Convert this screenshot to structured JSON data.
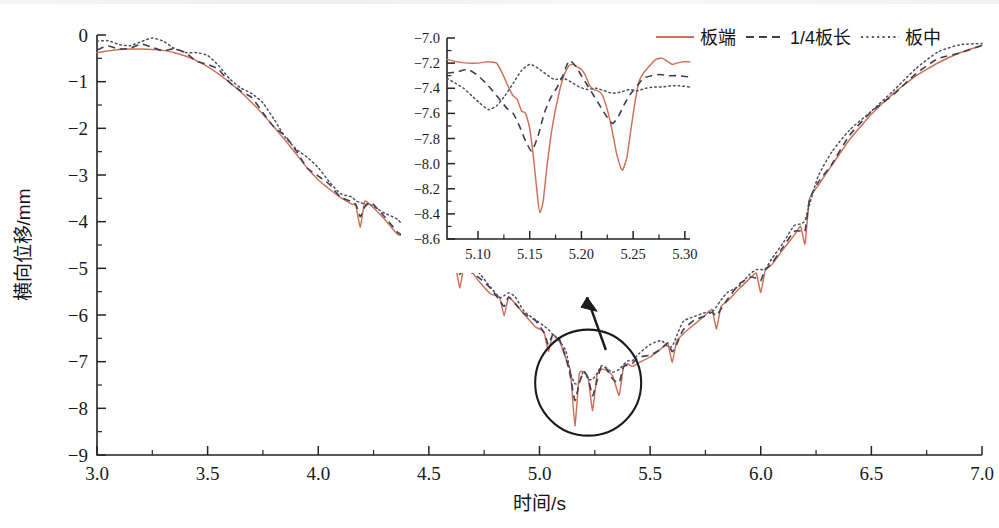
{
  "figure": {
    "background": "#ffffff",
    "colors": {
      "series_plate_end": "#cf6f57",
      "series_quarter": "#3a3f52",
      "series_plate_mid": "#4a5163",
      "axis": "#262321",
      "annotation": "#1b1b1b"
    }
  },
  "legend": {
    "position": "top-right",
    "items": [
      {
        "label": "板端",
        "style": "solid",
        "color": "#cf6f57"
      },
      {
        "label": "1/4板长",
        "style": "dashed",
        "color": "#3a3f52"
      },
      {
        "label": "板中",
        "style": "dotted",
        "color": "#4a5163"
      }
    ]
  },
  "chart_data": {
    "type": "line",
    "title": "",
    "xlabel": "时间/s",
    "ylabel": "横向位移/mm",
    "xlim": [
      3.0,
      7.0
    ],
    "ylim": [
      -9,
      0
    ],
    "xticks": [
      "3.0",
      "3.5",
      "4.0",
      "4.5",
      "5.0",
      "5.5",
      "6.0",
      "6.5",
      "7.0"
    ],
    "xtick_values": [
      3.0,
      3.5,
      4.0,
      4.5,
      5.0,
      5.5,
      6.0,
      6.5,
      7.0
    ],
    "yticks": [
      "0",
      "−1",
      "−2",
      "−3",
      "−4",
      "−5",
      "−6",
      "−7",
      "−8",
      "−9"
    ],
    "ytick_values": [
      0,
      -1,
      -2,
      -3,
      -4,
      -5,
      -6,
      -7,
      -8,
      -9
    ],
    "grid": false,
    "legend_position": "top-right",
    "series": [
      {
        "name": "板端",
        "style": "solid",
        "color": "#cf6f57",
        "description": "Transverse displacement of slab end; smooth bowl from -0.35 mm falling to about -8.4 mm minimum near 5.16 s, with sharp downward sawtooth spikes beginning near 4.17 s",
        "x": [
          3.0,
          3.05,
          3.1,
          3.15,
          3.2,
          3.25,
          3.3,
          3.35,
          3.4,
          3.45,
          3.5,
          3.55,
          3.6,
          3.65,
          3.7,
          3.75,
          3.8,
          3.85,
          3.9,
          3.95,
          4.0,
          4.05,
          4.1,
          4.15,
          4.17,
          4.19,
          4.21,
          4.24,
          4.3,
          4.36,
          4.4,
          4.42,
          4.44,
          4.47,
          4.52,
          4.58,
          4.62,
          4.64,
          4.66,
          4.69,
          4.73,
          4.78,
          4.82,
          4.84,
          4.86,
          4.89,
          4.93,
          4.98,
          5.02,
          5.04,
          5.06,
          5.09,
          5.12,
          5.14,
          5.16,
          5.18,
          5.2,
          5.22,
          5.24,
          5.26,
          5.28,
          5.3,
          5.33,
          5.36,
          5.38,
          5.4,
          5.42,
          5.45,
          5.5,
          5.55,
          5.58,
          5.6,
          5.62,
          5.65,
          5.7,
          5.75,
          5.78,
          5.8,
          5.82,
          5.85,
          5.9,
          5.95,
          5.98,
          6.0,
          6.02,
          6.05,
          6.1,
          6.15,
          6.18,
          6.2,
          6.22,
          6.26,
          6.32,
          6.4,
          6.5,
          6.6,
          6.7,
          6.8,
          6.9,
          7.0
        ],
        "y": [
          -0.38,
          -0.34,
          -0.31,
          -0.3,
          -0.3,
          -0.31,
          -0.33,
          -0.38,
          -0.45,
          -0.55,
          -0.68,
          -0.84,
          -1.02,
          -1.22,
          -1.45,
          -1.7,
          -1.97,
          -2.25,
          -2.55,
          -2.85,
          -3.1,
          -3.3,
          -3.48,
          -3.62,
          -3.66,
          -4.12,
          -3.56,
          -3.66,
          -3.95,
          -4.28,
          -4.32,
          -4.78,
          -4.28,
          -4.42,
          -4.7,
          -4.95,
          -4.96,
          -5.42,
          -4.92,
          -5.05,
          -5.3,
          -5.55,
          -5.62,
          -6.02,
          -5.62,
          -5.75,
          -5.98,
          -6.25,
          -6.36,
          -6.78,
          -6.42,
          -6.55,
          -6.95,
          -7.2,
          -8.38,
          -7.25,
          -7.22,
          -7.35,
          -8.05,
          -7.28,
          -7.16,
          -7.18,
          -7.3,
          -7.72,
          -7.1,
          -7.05,
          -7.1,
          -7.02,
          -6.9,
          -6.72,
          -6.6,
          -7.02,
          -6.56,
          -6.4,
          -6.2,
          -6.0,
          -5.88,
          -6.3,
          -5.82,
          -5.7,
          -5.45,
          -5.22,
          -5.1,
          -5.52,
          -5.05,
          -4.92,
          -4.6,
          -4.3,
          -4.1,
          -4.48,
          -3.52,
          -3.22,
          -2.8,
          -2.25,
          -1.7,
          -1.25,
          -0.88,
          -0.6,
          -0.38,
          -0.22
        ]
      },
      {
        "name": "1/4板长",
        "style": "dashed",
        "color": "#3a3f52",
        "description": "Quarter slab length; follows the slab-end curve closely with smaller amplitude oscillations"
      },
      {
        "name": "板中",
        "style": "dotted",
        "color": "#4a5163",
        "description": "Slab mid; smoothest of the three, slightly above the slab-end curve in the oscillating region"
      }
    ],
    "annotations": [
      {
        "type": "ellipse",
        "cx": 5.22,
        "cy": -7.45,
        "note": "circled detail region expanded in inset"
      },
      {
        "type": "arrow",
        "note": "points from circled region up to the inset axes"
      }
    ],
    "inset": {
      "xlim": [
        5.07,
        5.305
      ],
      "ylim": [
        -8.6,
        -7.0
      ],
      "xticks": [
        "5.10",
        "5.15",
        "5.20",
        "5.25",
        "5.30"
      ],
      "xtick_values": [
        5.1,
        5.15,
        5.2,
        5.25,
        5.3
      ],
      "yticks": [
        "−7.0",
        "−7.2",
        "−7.4",
        "−7.6",
        "−7.8",
        "−8.0",
        "−8.2",
        "−8.4",
        "−8.6"
      ],
      "ytick_values": [
        -7.0,
        -7.2,
        -7.4,
        -7.6,
        -7.8,
        -8.0,
        -8.2,
        -8.4,
        -8.6
      ],
      "series": [
        {
          "name": "板端",
          "style": "solid",
          "color": "#cf6f57",
          "x": [
            5.07,
            5.08,
            5.09,
            5.1,
            5.108,
            5.112,
            5.118,
            5.124,
            5.13,
            5.134,
            5.138,
            5.142,
            5.146,
            5.15,
            5.154,
            5.158,
            5.16,
            5.163,
            5.167,
            5.172,
            5.178,
            5.183,
            5.188,
            5.192,
            5.196,
            5.2,
            5.204,
            5.208,
            5.212,
            5.216,
            5.22,
            5.226,
            5.23,
            5.234,
            5.238,
            5.24,
            5.244,
            5.248,
            5.252,
            5.256,
            5.26,
            5.266,
            5.272,
            5.278,
            5.282,
            5.288,
            5.292,
            5.298,
            5.305
          ],
          "y": [
            -7.17,
            -7.19,
            -7.2,
            -7.2,
            -7.19,
            -7.19,
            -7.2,
            -7.29,
            -7.4,
            -7.46,
            -7.49,
            -7.58,
            -7.6,
            -7.72,
            -7.98,
            -8.3,
            -8.39,
            -8.3,
            -8.0,
            -7.7,
            -7.45,
            -7.3,
            -7.22,
            -7.21,
            -7.23,
            -7.25,
            -7.3,
            -7.38,
            -7.41,
            -7.42,
            -7.45,
            -7.6,
            -7.75,
            -7.92,
            -8.03,
            -8.05,
            -7.95,
            -7.72,
            -7.5,
            -7.34,
            -7.28,
            -7.22,
            -7.17,
            -7.16,
            -7.18,
            -7.21,
            -7.2,
            -7.19,
            -7.19
          ]
        },
        {
          "name": "1/4板长",
          "style": "dashed",
          "color": "#3a3f52",
          "x": [
            5.07,
            5.08,
            5.09,
            5.1,
            5.11,
            5.12,
            5.128,
            5.134,
            5.14,
            5.146,
            5.152,
            5.158,
            5.164,
            5.17,
            5.176,
            5.182,
            5.188,
            5.194,
            5.2,
            5.206,
            5.212,
            5.218,
            5.224,
            5.23,
            5.236,
            5.242,
            5.248,
            5.254,
            5.26,
            5.268,
            5.276,
            5.284,
            5.292,
            5.305
          ],
          "y": [
            -7.28,
            -7.27,
            -7.25,
            -7.3,
            -7.38,
            -7.48,
            -7.56,
            -7.6,
            -7.7,
            -7.82,
            -7.9,
            -7.78,
            -7.6,
            -7.48,
            -7.4,
            -7.3,
            -7.18,
            -7.22,
            -7.3,
            -7.38,
            -7.46,
            -7.54,
            -7.62,
            -7.68,
            -7.62,
            -7.52,
            -7.44,
            -7.38,
            -7.32,
            -7.3,
            -7.29,
            -7.3,
            -7.3,
            -7.31
          ]
        },
        {
          "name": "板中",
          "style": "dotted",
          "color": "#4a5163",
          "x": [
            5.07,
            5.078,
            5.086,
            5.094,
            5.102,
            5.11,
            5.118,
            5.126,
            5.134,
            5.142,
            5.15,
            5.158,
            5.166,
            5.174,
            5.182,
            5.19,
            5.198,
            5.206,
            5.214,
            5.222,
            5.23,
            5.238,
            5.246,
            5.254,
            5.262,
            5.27,
            5.278,
            5.286,
            5.294,
            5.305
          ],
          "y": [
            -7.32,
            -7.36,
            -7.4,
            -7.46,
            -7.52,
            -7.57,
            -7.54,
            -7.46,
            -7.36,
            -7.26,
            -7.21,
            -7.24,
            -7.29,
            -7.33,
            -7.32,
            -7.35,
            -7.39,
            -7.41,
            -7.4,
            -7.42,
            -7.44,
            -7.43,
            -7.41,
            -7.42,
            -7.4,
            -7.39,
            -7.39,
            -7.38,
            -7.38,
            -7.39
          ]
        }
      ]
    }
  }
}
